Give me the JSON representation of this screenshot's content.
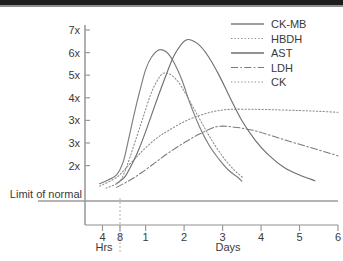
{
  "chart_data": {
    "type": "line",
    "title": "",
    "xlabel": "",
    "ylabel": "",
    "x_axis": {
      "hours_label": "Hrs",
      "days_label": "Days",
      "hour_ticks": [
        "4",
        "8"
      ],
      "day_ticks": [
        "1",
        "2",
        "3",
        "4",
        "5",
        "6"
      ],
      "divider_note": "dotted divider between hours and days segments"
    },
    "y_axis": {
      "tick_labels": [
        "7x",
        "6x",
        "5x",
        "4x",
        "3x",
        "3x",
        "2x"
      ],
      "baseline_label": "Limit of normal",
      "ylim": [
        1,
        7
      ],
      "grid": false
    },
    "legend": {
      "position": "top-right",
      "entries": [
        {
          "name": "CK-MB",
          "style": "solid",
          "color": "#7d7d7d"
        },
        {
          "name": "HBDH",
          "style": "dotted",
          "color": "#8a8a8a"
        },
        {
          "name": "AST",
          "style": "solid",
          "color": "#6f6f6f"
        },
        {
          "name": "LDH",
          "style": "dashdot",
          "color": "#7a7a7a"
        },
        {
          "name": "CK",
          "style": "dotted",
          "color": "#8a8a8a"
        }
      ]
    },
    "series": [
      {
        "name": "CK-MB",
        "style": "solid",
        "peak_value": 6.1,
        "peak_time_days": 1.35,
        "returns_to_normal_days": 3.4,
        "points": [
          [
            0.14,
            0.7
          ],
          [
            0.22,
            0.85
          ],
          [
            0.3,
            1.05
          ],
          [
            0.42,
            1.6
          ],
          [
            0.55,
            2.45
          ],
          [
            0.7,
            3.5
          ],
          [
            0.85,
            4.45
          ],
          [
            1.0,
            5.3
          ],
          [
            1.15,
            5.8
          ],
          [
            1.35,
            6.1
          ],
          [
            1.55,
            6.0
          ],
          [
            1.75,
            5.55
          ],
          [
            1.95,
            4.85
          ],
          [
            2.15,
            3.95
          ],
          [
            2.4,
            3.0
          ],
          [
            2.65,
            2.25
          ],
          [
            2.9,
            1.7
          ],
          [
            3.15,
            1.25
          ],
          [
            3.4,
            0.95
          ],
          [
            3.5,
            0.8
          ]
        ]
      },
      {
        "name": "HBDH",
        "style": "dotted",
        "peak_value": 3.7,
        "peak_time_days": 3.2,
        "plateau_value": 3.65,
        "points": [
          [
            0.14,
            0.6
          ],
          [
            0.3,
            0.95
          ],
          [
            0.5,
            1.35
          ],
          [
            0.75,
            1.75
          ],
          [
            1.0,
            2.15
          ],
          [
            1.3,
            2.55
          ],
          [
            1.6,
            2.85
          ],
          [
            2.0,
            3.2
          ],
          [
            2.4,
            3.45
          ],
          [
            2.8,
            3.62
          ],
          [
            3.2,
            3.7
          ],
          [
            3.8,
            3.7
          ],
          [
            4.4,
            3.68
          ],
          [
            5.0,
            3.65
          ],
          [
            5.5,
            3.62
          ],
          [
            6.0,
            3.58
          ]
        ]
      },
      {
        "name": "AST",
        "style": "solid",
        "peak_value": 6.5,
        "peak_time_days": 2.05,
        "returns_to_normal_days": 5.0,
        "points": [
          [
            0.3,
            0.7
          ],
          [
            0.45,
            0.95
          ],
          [
            0.6,
            1.35
          ],
          [
            0.8,
            2.0
          ],
          [
            1.0,
            2.8
          ],
          [
            1.25,
            3.9
          ],
          [
            1.5,
            4.95
          ],
          [
            1.75,
            5.9
          ],
          [
            2.05,
            6.5
          ],
          [
            2.35,
            6.35
          ],
          [
            2.6,
            5.9
          ],
          [
            2.9,
            5.1
          ],
          [
            3.2,
            4.15
          ],
          [
            3.5,
            3.25
          ],
          [
            3.85,
            2.45
          ],
          [
            4.2,
            1.85
          ],
          [
            4.6,
            1.35
          ],
          [
            5.0,
            1.05
          ],
          [
            5.4,
            0.82
          ]
        ]
      },
      {
        "name": "LDH",
        "style": "dashdot",
        "peak_value": 3.0,
        "peak_time_days": 2.85,
        "points": [
          [
            0.3,
            0.55
          ],
          [
            0.6,
            0.85
          ],
          [
            0.9,
            1.15
          ],
          [
            1.25,
            1.55
          ],
          [
            1.6,
            1.95
          ],
          [
            2.0,
            2.35
          ],
          [
            2.4,
            2.7
          ],
          [
            2.85,
            3.0
          ],
          [
            3.3,
            2.98
          ],
          [
            3.8,
            2.85
          ],
          [
            4.3,
            2.62
          ],
          [
            4.8,
            2.38
          ],
          [
            5.3,
            2.15
          ],
          [
            5.8,
            1.92
          ],
          [
            6.0,
            1.82
          ]
        ]
      },
      {
        "name": "CK",
        "style": "dotted",
        "peak_value": 5.15,
        "peak_time_days": 1.45,
        "returns_to_normal_days": 3.5,
        "points": [
          [
            0.2,
            0.52
          ],
          [
            0.32,
            0.75
          ],
          [
            0.45,
            1.15
          ],
          [
            0.6,
            1.8
          ],
          [
            0.78,
            2.65
          ],
          [
            0.95,
            3.45
          ],
          [
            1.12,
            4.25
          ],
          [
            1.28,
            4.8
          ],
          [
            1.45,
            5.15
          ],
          [
            1.65,
            5.1
          ],
          [
            1.85,
            4.8
          ],
          [
            2.05,
            4.3
          ],
          [
            2.3,
            3.6
          ],
          [
            2.55,
            2.9
          ],
          [
            2.8,
            2.25
          ],
          [
            3.05,
            1.7
          ],
          [
            3.3,
            1.25
          ],
          [
            3.55,
            0.92
          ]
        ]
      }
    ]
  }
}
